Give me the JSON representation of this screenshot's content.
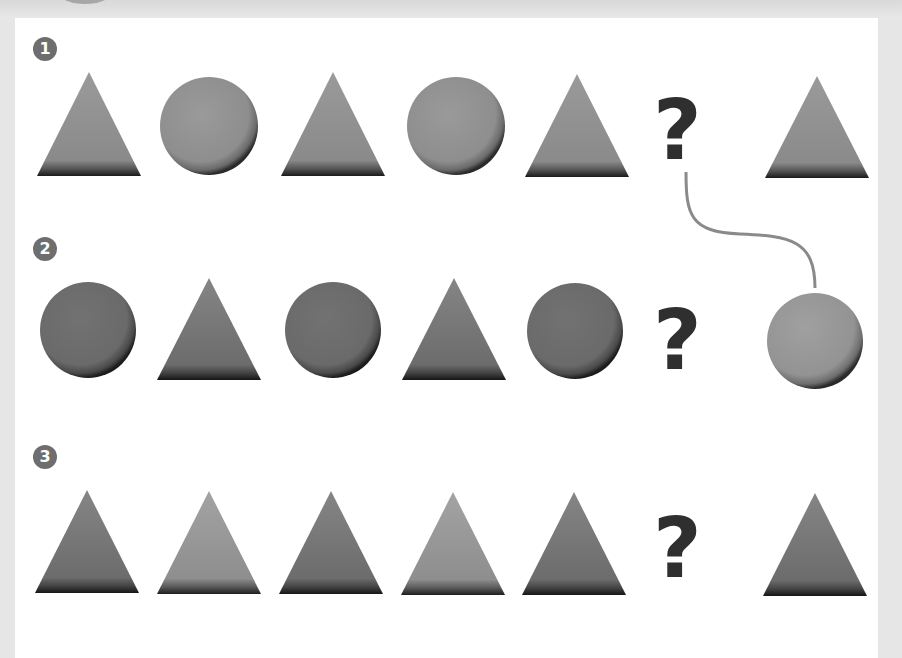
{
  "puzzle": {
    "rows": [
      {
        "number": "1",
        "sequence": [
          "triangle",
          "circle",
          "triangle",
          "circle",
          "triangle"
        ],
        "question": "?",
        "answer": "triangle",
        "colors": [
          "#8c8c8c",
          "#8c8c8c",
          "#8c8c8c",
          "#8c8c8c",
          "#8c8c8c"
        ],
        "answer_color": "#8c8c8c"
      },
      {
        "number": "2",
        "sequence": [
          "circle",
          "triangle",
          "circle",
          "triangle",
          "circle"
        ],
        "question": "?",
        "answer": "circle",
        "colors": [
          "#6a6a6a",
          "#6a6a6a",
          "#6a6a6a",
          "#6a6a6a",
          "#6a6a6a"
        ],
        "answer_color": "#8c8c8c"
      },
      {
        "number": "3",
        "sequence": [
          "triangle",
          "triangle",
          "triangle",
          "triangle",
          "triangle"
        ],
        "question": "?",
        "answer": "triangle",
        "colors": [
          "#6e6e6e",
          "#939393",
          "#6e6e6e",
          "#939393",
          "#6e6e6e"
        ],
        "answer_color": "#6e6e6e"
      }
    ],
    "connector": {
      "from_row": 1,
      "to_row": 2,
      "color": "#8a8a8a"
    }
  }
}
